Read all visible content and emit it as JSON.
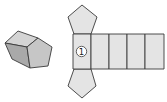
{
  "diagram": {
    "colors": {
      "stroke": "#3a3a3a",
      "fill_light": "#e4e4e4",
      "fill_top": "#d4d4d4",
      "fill_side": "#a9a9a9",
      "fill_front": "#c6c6c6",
      "background": "#ffffff"
    },
    "prism": {
      "faces": {
        "top": "5,43 18,31 38,38 27,47",
        "side": "5,43 27,47 30,68 12,59",
        "front": "27,47 38,38 52,47 48,66 30,68"
      }
    },
    "net": {
      "top_pentagon": "74,34 68,17 82,5 97,17 91,34",
      "bottom_pentagon": "74,69 91,69 96,86 82,98 68,86",
      "rectangles": [
        {
          "x": 73,
          "y": 34,
          "w": 18,
          "h": 35,
          "label": "①"
        },
        {
          "x": 91,
          "y": 34,
          "w": 18,
          "h": 35,
          "label": ""
        },
        {
          "x": 109,
          "y": 34,
          "w": 18,
          "h": 35,
          "label": ""
        },
        {
          "x": 127,
          "y": 34,
          "w": 18,
          "h": 35,
          "label": ""
        },
        {
          "x": 145,
          "y": 34,
          "w": 19,
          "h": 35,
          "label": ""
        }
      ],
      "marker_label": "1"
    }
  }
}
